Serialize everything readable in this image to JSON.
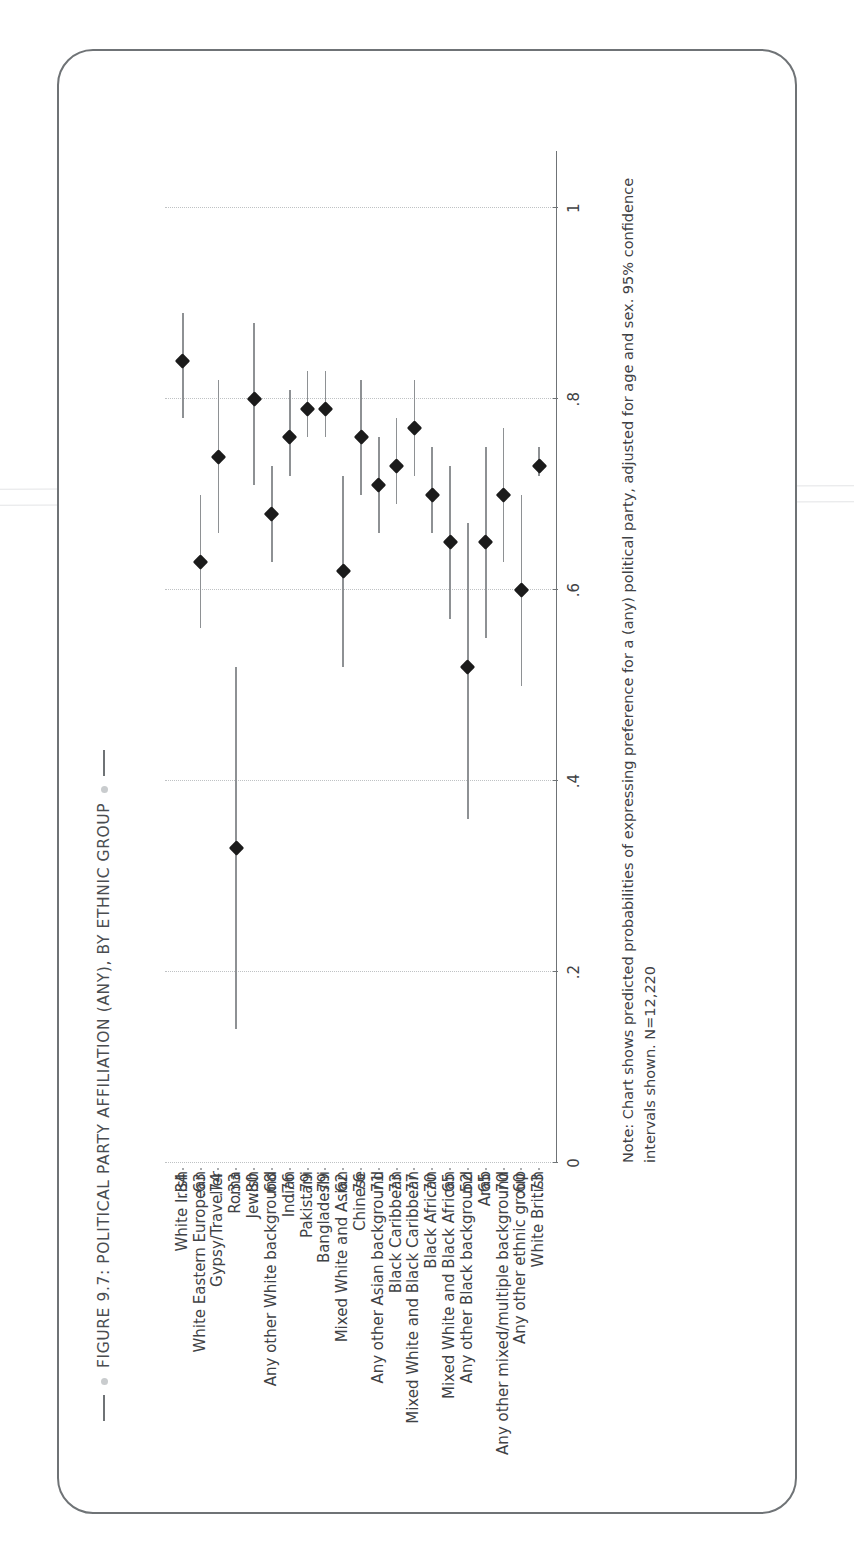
{
  "figure": {
    "title": "FIGURE 9.7: POLITICAL PARTY AFFILIATION (ANY), BY ETHNIC GROUP",
    "note": "Note: Chart shows predicted probabilities of expressing preference for a (any) political party, adjusted for age and sex. 95% confidence intervals shown. N=12,220"
  },
  "chart_data": {
    "type": "scatter",
    "orientation": "horizontal-dot-plot-rotated",
    "title": "FIGURE 9.7: POLITICAL PARTY AFFILIATION (ANY), BY ETHNIC GROUP",
    "xlabel": "",
    "ylabel": "",
    "xlim": [
      0,
      1.06
    ],
    "xticks": [
      0,
      0.2,
      0.4,
      0.6,
      0.8,
      1
    ],
    "xticklabels": [
      "0",
      ".2",
      ".4",
      ".6",
      ".8",
      "1"
    ],
    "grid": "vertical-dotted",
    "legend": "none",
    "categories": [
      "White Irish",
      "White Eastern European",
      "Gypsy/Traveller",
      "Roma",
      "Jewish",
      "Any other White background",
      "Indian",
      "Pakistani",
      "Bangladeshi",
      "Mixed White and Asian",
      "Chinese",
      "Any other Asian background",
      "Black Caribbean",
      "Mixed White and Black Caribbean",
      "Black African",
      "Mixed White and Black African",
      "Any other Black background",
      "Arab",
      "Any other mixed/multiple background",
      "Any other ethnic group",
      "White British"
    ],
    "value_labels": [
      ".84",
      ".63",
      ".74",
      ".33",
      ".80",
      ".68",
      ".76",
      ".79",
      ".79",
      ".62",
      ".76",
      ".71",
      ".73",
      ".77",
      ".70",
      ".65",
      ".52",
      ".65",
      ".70",
      ".60",
      ".73"
    ],
    "values": [
      0.84,
      0.63,
      0.74,
      0.33,
      0.8,
      0.68,
      0.76,
      0.79,
      0.79,
      0.62,
      0.76,
      0.71,
      0.73,
      0.77,
      0.7,
      0.65,
      0.52,
      0.65,
      0.7,
      0.6,
      0.73
    ],
    "ci_low": [
      0.78,
      0.56,
      0.66,
      0.14,
      0.71,
      0.63,
      0.72,
      0.76,
      0.76,
      0.52,
      0.7,
      0.66,
      0.69,
      0.72,
      0.66,
      0.57,
      0.36,
      0.55,
      0.63,
      0.5,
      0.72
    ],
    "ci_high": [
      0.89,
      0.7,
      0.82,
      0.52,
      0.88,
      0.73,
      0.81,
      0.83,
      0.83,
      0.72,
      0.82,
      0.76,
      0.78,
      0.82,
      0.75,
      0.73,
      0.67,
      0.75,
      0.77,
      0.7,
      0.75
    ],
    "ci_level": "95%",
    "n": "N=12,220"
  }
}
